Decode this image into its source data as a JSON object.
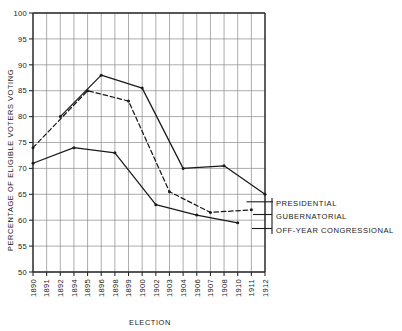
{
  "chart_data": {
    "type": "line",
    "title": "",
    "xlabel": "ELECTION",
    "ylabel": "PERCENTAGE OF ELIGIBLE VOTERS VOTING",
    "ylim": [
      50,
      100
    ],
    "yticks": [
      50,
      55,
      60,
      65,
      70,
      75,
      80,
      85,
      90,
      95,
      100
    ],
    "categories": [
      "1890",
      "1891",
      "1892",
      "1894",
      "1895",
      "1896",
      "1898",
      "1899",
      "1900",
      "1902",
      "1903",
      "1904",
      "1906",
      "1907",
      "1908",
      "1910",
      "1911",
      "1912"
    ],
    "grid": true,
    "legend_position": "right-inline",
    "series": [
      {
        "name": "PRESIDENTIAL",
        "style": "solid",
        "points": [
          {
            "x": "1892",
            "y": 80.0
          },
          {
            "x": "1896",
            "y": 88.0
          },
          {
            "x": "1900",
            "y": 85.5
          },
          {
            "x": "1904",
            "y": 70.0
          },
          {
            "x": "1908",
            "y": 70.5
          },
          {
            "x": "1912",
            "y": 65.0
          }
        ]
      },
      {
        "name": "GUBERNATORIAL",
        "style": "dashed",
        "points": [
          {
            "x": "1890",
            "y": 74.0
          },
          {
            "x": "1895",
            "y": 85.0
          },
          {
            "x": "1899",
            "y": 83.0
          },
          {
            "x": "1903",
            "y": 65.5
          },
          {
            "x": "1907",
            "y": 61.5
          },
          {
            "x": "1911",
            "y": 62.0
          }
        ]
      },
      {
        "name": "OFF-YEAR CONGRESSIONAL",
        "style": "solid",
        "points": [
          {
            "x": "1890",
            "y": 71.0
          },
          {
            "x": "1894",
            "y": 74.0
          },
          {
            "x": "1898",
            "y": 73.0
          },
          {
            "x": "1902",
            "y": 63.0
          },
          {
            "x": "1906",
            "y": 61.0
          },
          {
            "x": "1910",
            "y": 59.5
          }
        ]
      }
    ]
  },
  "legend": {
    "items": [
      {
        "label": "PRESIDENTIAL"
      },
      {
        "label": "GUBERNATORIAL"
      },
      {
        "label": "OFF-YEAR CONGRESSIONAL"
      }
    ]
  },
  "colors": {
    "ink": "#1a1a1a",
    "grid": "#8a8a8a",
    "background": "#ffffff"
  }
}
